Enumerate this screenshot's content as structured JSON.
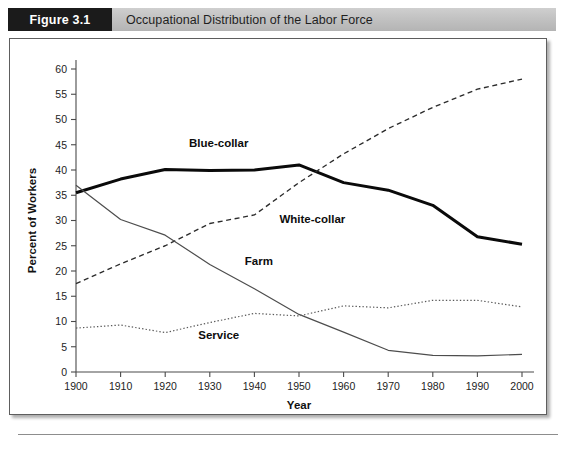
{
  "figure": {
    "number_label": "Figure 3.1",
    "title": "Occupational Distribution of the Labor Force"
  },
  "colors": {
    "header_box": "#1b1b1b",
    "header_band": "#c2c2c2",
    "panel_border": "#5e5e5e",
    "blue_collar": "#0a0a0a",
    "white_collar": "#2b2b2b",
    "farm": "#4d4d4d",
    "service": "#5a5a5a"
  },
  "chart_data": {
    "type": "line",
    "title": "Occupational Distribution of the Labor Force",
    "subtitle": "",
    "xlabel": "Year",
    "ylabel": "Percent of Workers",
    "xlim": [
      1900,
      2000
    ],
    "ylim": [
      0,
      60
    ],
    "xticks": [
      1900,
      1910,
      1920,
      1930,
      1940,
      1950,
      1960,
      1970,
      1980,
      1990,
      2000
    ],
    "yticks": [
      0,
      5,
      10,
      15,
      20,
      25,
      30,
      35,
      40,
      45,
      50,
      55,
      60
    ],
    "grid": false,
    "legend_position": "inline-annotations",
    "x": [
      1900,
      1910,
      1920,
      1930,
      1940,
      1950,
      1960,
      1970,
      1980,
      1990,
      2000
    ],
    "series": [
      {
        "name": "Blue-collar",
        "style": "thick-solid",
        "values": [
          35.5,
          38.2,
          40.1,
          39.9,
          40.0,
          41.0,
          37.5,
          36.0,
          33.0,
          26.8,
          25.3
        ],
        "label_x": 1932,
        "label_y": 44.5
      },
      {
        "name": "White-collar",
        "style": "dashed",
        "values": [
          17.5,
          21.4,
          25.0,
          29.4,
          31.1,
          37.5,
          43.2,
          48.2,
          52.4,
          56.0,
          58.0
        ],
        "label_x": 1953,
        "label_y": 29.5
      },
      {
        "name": "Farm",
        "style": "thin-solid",
        "values": [
          37.0,
          30.2,
          27.1,
          21.3,
          16.5,
          11.4,
          7.9,
          4.3,
          3.3,
          3.2,
          3.5
        ],
        "label_x": 1941,
        "label_y": 21.2
      },
      {
        "name": "Service",
        "style": "dotted",
        "values": [
          8.7,
          9.3,
          7.8,
          9.8,
          11.6,
          11.1,
          13.1,
          12.7,
          14.2,
          14.2,
          12.9
        ],
        "label_x": 1932,
        "label_y": 6.6
      }
    ]
  }
}
